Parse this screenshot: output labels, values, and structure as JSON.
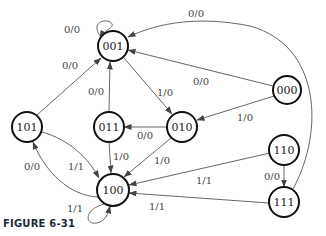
{
  "caption": "FIGURE 6-31",
  "diagram": {
    "type": "state-diagram",
    "nodes": [
      {
        "id": "001",
        "label": "001",
        "x": 113,
        "y": 46
      },
      {
        "id": "000",
        "label": "000",
        "x": 287,
        "y": 90
      },
      {
        "id": "101",
        "label": "101",
        "x": 27,
        "y": 127
      },
      {
        "id": "011",
        "label": "011",
        "x": 109,
        "y": 127
      },
      {
        "id": "010",
        "label": "010",
        "x": 182,
        "y": 127
      },
      {
        "id": "110",
        "label": "110",
        "x": 284,
        "y": 150
      },
      {
        "id": "100",
        "label": "100",
        "x": 113,
        "y": 190
      },
      {
        "id": "111",
        "label": "111",
        "x": 284,
        "y": 202
      }
    ],
    "edges": [
      {
        "from": "001",
        "to": "001",
        "label": "0/0"
      },
      {
        "from": "101",
        "to": "001",
        "label": "0/0"
      },
      {
        "from": "011",
        "to": "001",
        "label": "0/0"
      },
      {
        "from": "001",
        "to": "010",
        "label": "1/0"
      },
      {
        "from": "000",
        "to": "001",
        "label": "0/0"
      },
      {
        "from": "000",
        "to": "010",
        "label": "1/0"
      },
      {
        "from": "111",
        "to": "001",
        "label": "0/0"
      },
      {
        "from": "010",
        "to": "011",
        "label": "0/0"
      },
      {
        "from": "011",
        "to": "100",
        "label": "1/0"
      },
      {
        "from": "010",
        "to": "100",
        "label": "1/0"
      },
      {
        "from": "101",
        "to": "100",
        "label": "1/1"
      },
      {
        "from": "100",
        "to": "101",
        "label": "0/0"
      },
      {
        "from": "100",
        "to": "100",
        "label": "1/1"
      },
      {
        "from": "110",
        "to": "100",
        "label": "1/1"
      },
      {
        "from": "111",
        "to": "100",
        "label": "1/1"
      },
      {
        "from": "110",
        "to": "111",
        "label": "0/0"
      }
    ]
  }
}
